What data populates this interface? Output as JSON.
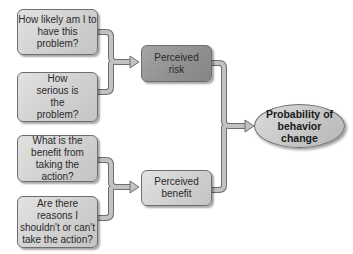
{
  "diagram": {
    "questions": [
      {
        "id": "q1",
        "text": "How likely am I to have this problem?"
      },
      {
        "id": "q2",
        "text": "How serious is the problem?"
      },
      {
        "id": "q3",
        "text": "What is the benefit from taking the action?"
      },
      {
        "id": "q4",
        "text": "Are there reasons I shouldn't or can't take the action?"
      }
    ],
    "factors": [
      {
        "id": "risk",
        "text": "Perceived risk",
        "inputs": [
          "q1",
          "q2"
        ]
      },
      {
        "id": "benefit",
        "text": "Perceived benefit",
        "inputs": [
          "q3",
          "q4"
        ]
      }
    ],
    "outcome": {
      "id": "outcome",
      "text": "Probability of behavior change",
      "inputs": [
        "risk",
        "benefit"
      ]
    },
    "colors": {
      "box_light": "#cfcfcf",
      "box_dark": "#8f8f8f",
      "connector": "#b5b5b5",
      "connector_outline": "#6e6e6e"
    }
  }
}
